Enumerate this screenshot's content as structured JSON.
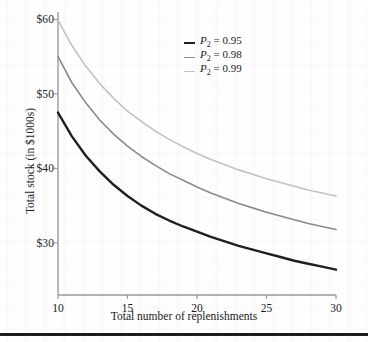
{
  "figure": {
    "background_color": "#fefefe",
    "frame_color": "#9a9a9a"
  },
  "axes": {
    "x": {
      "label": "Total number of replenishments",
      "ticks": [
        "10",
        "15",
        "20",
        "25",
        "30"
      ],
      "tick_values": [
        10,
        15,
        20,
        25,
        30
      ],
      "range": [
        10,
        30
      ]
    },
    "y": {
      "label": "Total stock (in $1000s)",
      "ticks": [
        "$30",
        "$40",
        "$50",
        "$60"
      ],
      "tick_values": [
        30,
        40,
        50,
        60
      ],
      "range": [
        23,
        61
      ]
    }
  },
  "legend": {
    "entries": [
      {
        "symbol": "P",
        "subscript": "2",
        "equals": " = ",
        "value": "0.95",
        "color": "#1f1f1f",
        "width": 2.4
      },
      {
        "symbol": "P",
        "subscript": "2",
        "equals": " = ",
        "value": "0.98",
        "color": "#8a8a8a",
        "width": 1.6
      },
      {
        "symbol": "P",
        "subscript": "2",
        "equals": " = ",
        "value": "0.99",
        "color": "#c2c2c2",
        "width": 1.6
      }
    ]
  },
  "chart_data": {
    "type": "line",
    "title": "",
    "xlabel": "Total number of replenishments",
    "ylabel": "Total stock (in $1000s)",
    "xlim": [
      10,
      30
    ],
    "ylim": [
      23,
      61
    ],
    "grid": false,
    "legend_position": "top-center",
    "x": [
      10,
      11,
      12,
      13,
      14,
      15,
      16,
      17,
      18,
      19,
      20,
      21,
      22,
      23,
      24,
      25,
      26,
      27,
      28,
      29,
      30
    ],
    "series": [
      {
        "name": "P2 = 0.95",
        "color": "#1f1f1f",
        "values": [
          47.5,
          44.3,
          41.7,
          39.6,
          37.8,
          36.3,
          35.0,
          33.9,
          33.0,
          32.2,
          31.5,
          30.8,
          30.2,
          29.6,
          29.1,
          28.6,
          28.1,
          27.6,
          27.2,
          26.8,
          26.4
        ]
      },
      {
        "name": "P2 = 0.98",
        "color": "#8a8a8a",
        "values": [
          55.0,
          51.5,
          48.8,
          46.5,
          44.6,
          43.0,
          41.6,
          40.4,
          39.3,
          38.4,
          37.5,
          36.7,
          36.0,
          35.3,
          34.7,
          34.1,
          33.6,
          33.1,
          32.6,
          32.2,
          31.8
        ]
      },
      {
        "name": "P2 = 0.99",
        "color": "#c2c2c2",
        "values": [
          59.9,
          56.5,
          53.7,
          51.4,
          49.4,
          47.7,
          46.3,
          45.0,
          43.9,
          42.9,
          42.0,
          41.2,
          40.5,
          39.8,
          39.2,
          38.6,
          38.1,
          37.6,
          37.1,
          36.7,
          36.3
        ]
      }
    ]
  }
}
